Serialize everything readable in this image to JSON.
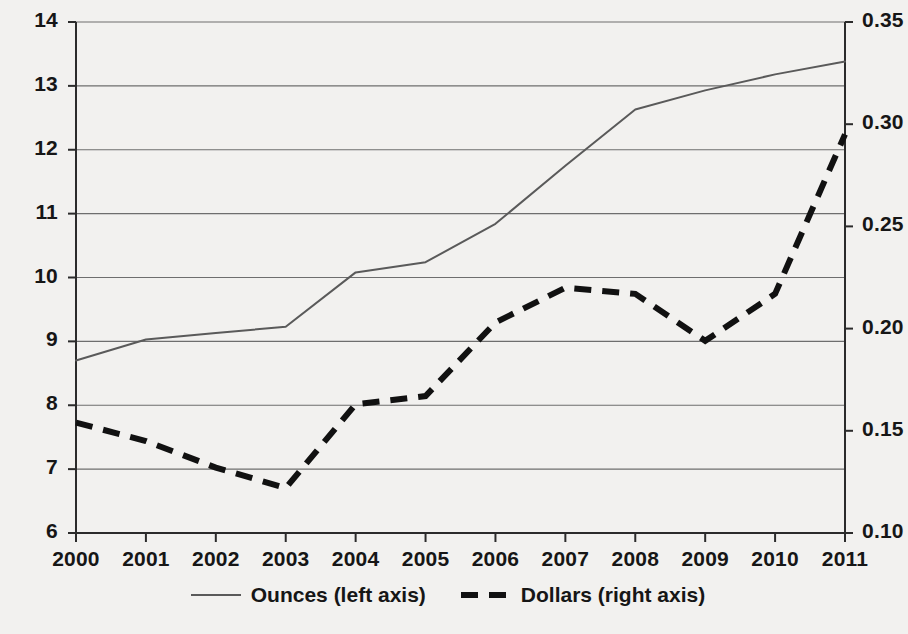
{
  "chart_data": {
    "type": "line",
    "title": "",
    "subtitle": "",
    "xlabel": "",
    "ylabel": "",
    "grid": true,
    "legend_position": "bottom",
    "x": [
      2000,
      2001,
      2002,
      2003,
      2004,
      2005,
      2006,
      2007,
      2008,
      2009,
      2010,
      2011
    ],
    "x_tick_labels": [
      "2000",
      "2001",
      "2002",
      "2003",
      "2004",
      "2005",
      "2006",
      "2007",
      "2008",
      "2009",
      "2010",
      "2011"
    ],
    "axes": {
      "left": {
        "label": "Ounces",
        "ylim": [
          6,
          14
        ],
        "tick_step": 1,
        "tick_labels": [
          "14",
          "13",
          "12",
          "11",
          "10",
          "9",
          "8",
          "7",
          "6"
        ],
        "tick_values": [
          14,
          13,
          12,
          11,
          10,
          9,
          8,
          7,
          6
        ]
      },
      "right": {
        "label": "Dollars",
        "ylim": [
          0.1,
          0.35
        ],
        "tick_step": 0.05,
        "tick_labels": [
          "0.35",
          "0.30",
          "0.25",
          "0.20",
          "0.15",
          "0.10"
        ],
        "tick_values": [
          0.35,
          0.3,
          0.25,
          0.2,
          0.15,
          0.1
        ]
      }
    },
    "series": [
      {
        "name": "Ounces (left axis)",
        "axis": "left",
        "style": "solid",
        "color": "#5a5a5a",
        "values": [
          8.7,
          9.03,
          9.13,
          9.23,
          10.08,
          10.24,
          10.84,
          11.75,
          12.63,
          12.93,
          13.18,
          13.38
        ]
      },
      {
        "name": "Dollars (right axis)",
        "axis": "right",
        "style": "dashed",
        "color": "#111111",
        "values": [
          0.154,
          0.145,
          0.132,
          0.122,
          0.163,
          0.167,
          0.203,
          0.22,
          0.217,
          0.194,
          0.217,
          0.295
        ]
      }
    ],
    "legend": [
      {
        "label": "Ounces (left axis)",
        "style": "solid"
      },
      {
        "label": "Dollars (right axis)",
        "style": "dashed"
      }
    ]
  },
  "colors": {
    "background": "#f2f1ef",
    "axis": "#2b2b2b",
    "grid": "#6e6e6e",
    "ounces_line": "#5a5a5a",
    "dollars_line": "#111111"
  }
}
